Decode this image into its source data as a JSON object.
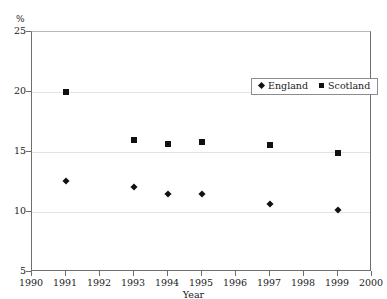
{
  "clipped_title": "",
  "chart_data": {
    "type": "scatter",
    "title": "",
    "xlabel": "Year",
    "ylabel": "%",
    "ylim": [
      5,
      25
    ],
    "xlim": [
      1990,
      2000
    ],
    "yticks": [
      25,
      20,
      15,
      10,
      5
    ],
    "xticks": [
      1990,
      1991,
      1992,
      1993,
      1994,
      1995,
      1996,
      1997,
      1998,
      1999,
      2000
    ],
    "grid": true,
    "legend_position": "top-right-inside",
    "series": [
      {
        "name": "England",
        "marker": "diamond",
        "color": "#111111",
        "points": [
          {
            "x": 1991,
            "y": 12.6
          },
          {
            "x": 1993,
            "y": 12.1
          },
          {
            "x": 1994,
            "y": 11.5
          },
          {
            "x": 1995,
            "y": 11.5
          },
          {
            "x": 1997,
            "y": 10.7
          },
          {
            "x": 1999,
            "y": 10.2
          }
        ]
      },
      {
        "name": "Scotland",
        "marker": "square",
        "color": "#111111",
        "points": [
          {
            "x": 1991,
            "y": 20.0
          },
          {
            "x": 1993,
            "y": 16.0
          },
          {
            "x": 1994,
            "y": 15.7
          },
          {
            "x": 1995,
            "y": 15.8
          },
          {
            "x": 1997,
            "y": 15.6
          },
          {
            "x": 1999,
            "y": 14.9
          }
        ]
      }
    ]
  }
}
